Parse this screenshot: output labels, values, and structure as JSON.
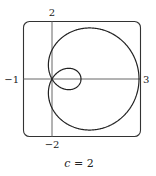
{
  "figure": {
    "caption": "c = 2",
    "caption_var": "c",
    "caption_eq": " = 2",
    "axis_labels": {
      "y_max": "2",
      "y_min": "−2",
      "x_min": "−1",
      "x_max": "3"
    },
    "colors": {
      "curve": "#222222",
      "axes": "#555555",
      "frame": "#333333"
    }
  },
  "chart_data": {
    "type": "polar-curve",
    "equation": "r = 1 + c·cos θ",
    "c": 2,
    "xlim": [
      -1,
      3
    ],
    "ylim": [
      -2,
      2
    ],
    "tick_labels": [
      "-1",
      "3",
      "2",
      "-2"
    ],
    "caption": "c = 2",
    "grid": false
  }
}
